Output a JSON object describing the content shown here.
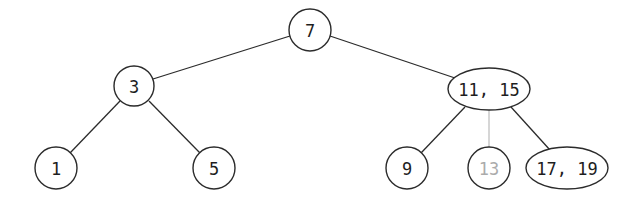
{
  "diagram": {
    "type": "2-3 search tree",
    "colors": {
      "stroke": "#2b2b2b",
      "text": "#1e1e1e",
      "ghost_text": "#ababab",
      "ghost_edge": "#b4b4b4",
      "background": "#ffffff"
    },
    "nodes": [
      {
        "id": "n7",
        "label": "7",
        "shape": "circle",
        "cx": 310,
        "cy": 30,
        "r": 21,
        "ghost": false
      },
      {
        "id": "n3",
        "label": "3",
        "shape": "circle",
        "cx": 134,
        "cy": 86,
        "r": 20,
        "ghost": false
      },
      {
        "id": "n1115",
        "label": "11, 15",
        "shape": "ellipse",
        "cx": 489,
        "cy": 89,
        "rx": 41,
        "ry": 21,
        "ghost": false
      },
      {
        "id": "n1",
        "label": "1",
        "shape": "circle",
        "cx": 56,
        "cy": 168,
        "r": 21,
        "ghost": false
      },
      {
        "id": "n5",
        "label": "5",
        "shape": "circle",
        "cx": 214,
        "cy": 168,
        "r": 21,
        "ghost": false
      },
      {
        "id": "n9",
        "label": "9",
        "shape": "circle",
        "cx": 407,
        "cy": 168,
        "r": 21,
        "ghost": false
      },
      {
        "id": "n13",
        "label": "13",
        "shape": "circle",
        "cx": 489,
        "cy": 168,
        "r": 21,
        "ghost": true
      },
      {
        "id": "n1719",
        "label": "17, 19",
        "shape": "ellipse",
        "cx": 567,
        "cy": 168,
        "rx": 41,
        "ry": 21,
        "ghost": false
      }
    ],
    "edges": [
      {
        "from": "n7",
        "to": "n3",
        "x1": 290,
        "y1": 36,
        "x2": 153,
        "y2": 79,
        "ghost": false
      },
      {
        "from": "n7",
        "to": "n1115",
        "x1": 330,
        "y1": 36,
        "x2": 455,
        "y2": 78,
        "ghost": false
      },
      {
        "from": "n3",
        "to": "n1",
        "x1": 120,
        "y1": 101,
        "x2": 70,
        "y2": 153,
        "ghost": false
      },
      {
        "from": "n3",
        "to": "n5",
        "x1": 149,
        "y1": 101,
        "x2": 200,
        "y2": 153,
        "ghost": false
      },
      {
        "from": "n1115",
        "to": "n9",
        "x1": 465,
        "y1": 107,
        "x2": 421,
        "y2": 153,
        "ghost": false
      },
      {
        "from": "n1115",
        "to": "n13",
        "x1": 489,
        "y1": 110,
        "x2": 489,
        "y2": 147,
        "ghost": true
      },
      {
        "from": "n1115",
        "to": "n1719",
        "x1": 511,
        "y1": 107,
        "x2": 550,
        "y2": 150,
        "ghost": false
      }
    ]
  }
}
